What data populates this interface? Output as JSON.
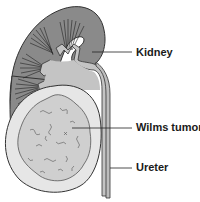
{
  "diagram": {
    "type": "anatomical illustration",
    "labels": [
      {
        "id": "kidney",
        "text": "Kidney"
      },
      {
        "id": "wilms",
        "text": "Wilms tumor"
      },
      {
        "id": "ureter",
        "text": "Ureter"
      }
    ],
    "colors": {
      "kidney_cortex": "#8a8a8a",
      "renal_pelvis": "#c4c4c4",
      "tumor_capsule": "#e6e6e6",
      "tumor_core": "#cfcfcf",
      "outline": "#333333",
      "leader_line": "#222222"
    }
  }
}
